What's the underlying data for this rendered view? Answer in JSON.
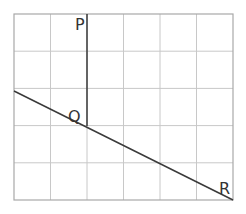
{
  "diagram": {
    "type": "geometry-grid",
    "grid": {
      "columns": 6,
      "rows": 5,
      "left": 14,
      "top": 14,
      "cell_width": 36.5,
      "cell_height": 37.2,
      "line_color": "#c8c8c8",
      "border_color": "#a8a8a8"
    },
    "points": [
      {
        "id": "P",
        "label": "P",
        "x": 87,
        "y": 14,
        "label_x": 75,
        "label_y": 30
      },
      {
        "id": "Q",
        "label": "Q",
        "x": 87,
        "y": 126,
        "label_x": 68,
        "label_y": 122
      },
      {
        "id": "R",
        "label": "R",
        "x": 233,
        "y": 200,
        "label_x": 219,
        "label_y": 194
      }
    ],
    "segments": [
      {
        "from": "P",
        "to": "Q",
        "description": "vertical line PQ"
      },
      {
        "from": "L",
        "to": "R",
        "description": "diagonal line through Q to R",
        "start_x": 14,
        "start_y": 91
      }
    ],
    "line_color": "#3a3a3a"
  }
}
